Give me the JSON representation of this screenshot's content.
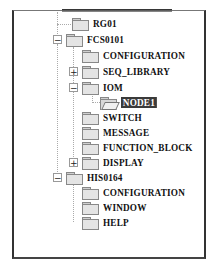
{
  "tree": {
    "partial_top_item": "COMMON_BLOCK",
    "items": [
      {
        "label": "RG01",
        "level": 2,
        "expander": null,
        "folder": "closed"
      },
      {
        "label": "FCS0101",
        "level": 1,
        "expander": "-",
        "folder": "closed"
      },
      {
        "label": "CONFIGURATION",
        "level": 2,
        "expander": null,
        "folder": "closed"
      },
      {
        "label": "SEQ_LIBRARY",
        "level": 2,
        "expander": "+",
        "folder": "closed"
      },
      {
        "label": "IOM",
        "level": 2,
        "expander": "-",
        "folder": "closed"
      },
      {
        "label": "NODE1",
        "level": 3,
        "expander": null,
        "folder": "open",
        "selected": true
      },
      {
        "label": "SWITCH",
        "level": 2,
        "expander": null,
        "folder": "closed"
      },
      {
        "label": "MESSAGE",
        "level": 2,
        "expander": null,
        "folder": "closed"
      },
      {
        "label": "FUNCTION_BLOCK",
        "level": 2,
        "expander": null,
        "folder": "closed"
      },
      {
        "label": "DISPLAY",
        "level": 2,
        "expander": "+",
        "folder": "closed"
      },
      {
        "label": "HIS0164",
        "level": 1,
        "expander": "-",
        "folder": "closed"
      },
      {
        "label": "CONFIGURATION",
        "level": 2,
        "expander": null,
        "folder": "closed"
      },
      {
        "label": "WINDOW",
        "level": 2,
        "expander": null,
        "folder": "closed"
      },
      {
        "label": "HELP",
        "level": 2,
        "expander": null,
        "folder": "closed"
      }
    ],
    "selection_color": "#3a3a3a"
  }
}
